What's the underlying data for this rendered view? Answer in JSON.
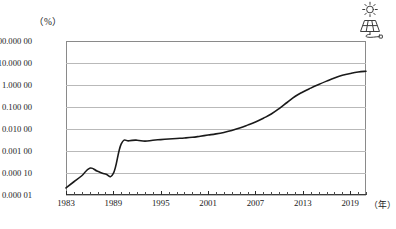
{
  "chart_data": {
    "type": "line",
    "title": "",
    "xlabel": "年",
    "ylabel": "%",
    "y_unit_label": "（%）",
    "x_unit_label": "（年）",
    "yscale": "log",
    "ylim": [
      1e-05,
      100.0
    ],
    "xlim": [
      1983,
      2021
    ],
    "grid": true,
    "legend": "none",
    "ytick_labels": [
      "100.000 00",
      "10.000 00",
      "1.000 00",
      "0.100 00",
      "0.010 00",
      "0.001 00",
      "0.000 10",
      "0.000 01"
    ],
    "ytick_values": [
      100.0,
      10.0,
      1.0,
      0.1,
      0.01,
      0.001,
      0.0001,
      1e-05
    ],
    "xtick_labels": [
      "1983",
      "1989",
      "1995",
      "2001",
      "2007",
      "2013",
      "2019"
    ],
    "xtick_values": [
      1983,
      1989,
      1995,
      2001,
      2007,
      2013,
      2019
    ],
    "series": [
      {
        "name": "太阳能发电占比",
        "color": "#1a1a1a",
        "x": [
          1983,
          1984,
          1985,
          1986,
          1987,
          1988,
          1989,
          1990,
          1991,
          1992,
          1993,
          1994,
          1995,
          1996,
          1997,
          1998,
          1999,
          2000,
          2001,
          2002,
          2003,
          2004,
          2005,
          2006,
          2007,
          2008,
          2009,
          2010,
          2011,
          2012,
          2013,
          2014,
          2015,
          2016,
          2017,
          2018,
          2019,
          2020,
          2021
        ],
        "values": [
          2.1e-05,
          4e-05,
          7.5e-05,
          0.000165,
          0.00012,
          9e-05,
          9.5e-05,
          0.0021,
          0.0029,
          0.0031,
          0.0028,
          0.0031,
          0.0033,
          0.0035,
          0.0037,
          0.0039,
          0.0042,
          0.0047,
          0.0053,
          0.006,
          0.007,
          0.0085,
          0.011,
          0.015,
          0.021,
          0.031,
          0.048,
          0.085,
          0.16,
          0.3,
          0.48,
          0.72,
          1.05,
          1.5,
          2.1,
          2.75,
          3.35,
          3.9,
          4.2
        ]
      }
    ]
  },
  "icon": {
    "name": "solar-panel-icon",
    "label": "solar panel with sun"
  }
}
